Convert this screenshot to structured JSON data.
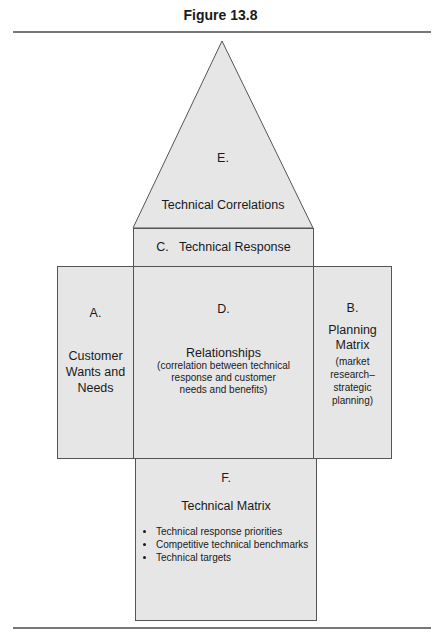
{
  "figure_title": "Figure 13.8",
  "sections": {
    "E": {
      "letter": "E.",
      "label": "Technical Correlations"
    },
    "C": {
      "label": "C.   Technical Response"
    },
    "A": {
      "letter": "A.",
      "label_lines": [
        "Customer",
        "Wants and",
        "Needs"
      ]
    },
    "D": {
      "letter": "D.",
      "label": "Relationships",
      "sub_lines": [
        "(correlation between technical",
        "response and customer",
        "needs and benefits)"
      ]
    },
    "B": {
      "letter": "B.",
      "label_lines": [
        "Planning",
        "Matrix"
      ],
      "sub_lines": [
        "(market",
        "research–",
        "strategic",
        "planning)"
      ]
    },
    "F": {
      "letter": "F.",
      "label": "Technical Matrix",
      "bullets": [
        "Technical response priorities",
        "Competitive technical benchmarks",
        "Technical targets"
      ]
    }
  },
  "colors": {
    "fill": "#e6e6e6",
    "stroke": "#555555",
    "rule": "#777777"
  }
}
